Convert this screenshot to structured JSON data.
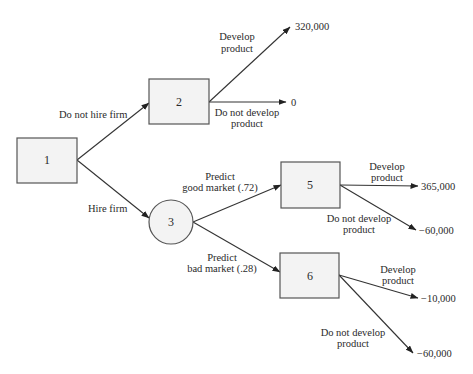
{
  "diagram": {
    "type": "decision-tree",
    "nodes": [
      {
        "id": "1",
        "label": "1",
        "shape": "decision"
      },
      {
        "id": "2",
        "label": "2",
        "shape": "decision"
      },
      {
        "id": "3",
        "label": "3",
        "shape": "chance"
      },
      {
        "id": "5",
        "label": "5",
        "shape": "decision"
      },
      {
        "id": "6",
        "label": "6",
        "shape": "decision"
      }
    ],
    "edges": {
      "e1_2": {
        "from": "1",
        "to": "2",
        "label": "Do not hire firm"
      },
      "e1_3": {
        "from": "1",
        "to": "3",
        "label": "Hire firm"
      },
      "e2_a": {
        "from": "2",
        "to": "payoff_2a",
        "line1": "Develop",
        "line2": "product"
      },
      "e2_b": {
        "from": "2",
        "to": "payoff_2b",
        "line1": "Do not develop",
        "line2": "product"
      },
      "e3_5": {
        "from": "3",
        "to": "5",
        "line1": "Predict",
        "line2": "good market (.72)"
      },
      "e3_6": {
        "from": "3",
        "to": "6",
        "line1": "Predict",
        "line2": "bad market (.28)"
      },
      "e5_a": {
        "from": "5",
        "to": "payoff_5a",
        "line1": "Develop",
        "line2": "product"
      },
      "e5_b": {
        "from": "5",
        "to": "payoff_5b",
        "line1": "Do not develop",
        "line2": "product"
      },
      "e6_a": {
        "from": "6",
        "to": "payoff_6a",
        "line1": "Develop",
        "line2": "product"
      },
      "e6_b": {
        "from": "6",
        "to": "payoff_6b",
        "line1": "Do not develop",
        "line2": "product"
      }
    },
    "payoffs": {
      "p2a": "320,000",
      "p2b": "0",
      "p5a": "365,000",
      "p5b": "−60,000",
      "p6a": "−10,000",
      "p6b": "−60,000"
    },
    "probabilities": {
      "good_market": 0.72,
      "bad_market": 0.28
    }
  }
}
